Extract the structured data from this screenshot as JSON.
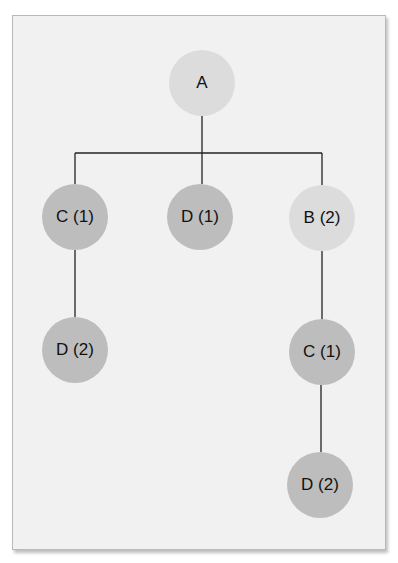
{
  "diagram": {
    "type": "tree",
    "colors": {
      "frame_bg": "#f1f1f1",
      "frame_border": "#b9b9b9",
      "node_light": "#dcdcdc",
      "node_dark": "#bdbdbd",
      "edge": "#222222"
    },
    "nodes": [
      {
        "id": "a",
        "label": "A",
        "x": 202,
        "y": 83,
        "shade": "light"
      },
      {
        "id": "c1-left",
        "label": "C (1)",
        "x": 75,
        "y": 217,
        "shade": "dark"
      },
      {
        "id": "d1-mid",
        "label": "D (1)",
        "x": 200,
        "y": 217,
        "shade": "dark"
      },
      {
        "id": "b2-right",
        "label": "B (2)",
        "x": 322,
        "y": 218,
        "shade": "light"
      },
      {
        "id": "d2-left",
        "label": "D (2)",
        "x": 75,
        "y": 350,
        "shade": "dark"
      },
      {
        "id": "c1-right",
        "label": "C (1)",
        "x": 322,
        "y": 352,
        "shade": "dark"
      },
      {
        "id": "d2-bottom",
        "label": "D (2)",
        "x": 320,
        "y": 485,
        "shade": "dark"
      }
    ],
    "edges": [
      [
        "a",
        "c1-left"
      ],
      [
        "a",
        "d1-mid"
      ],
      [
        "a",
        "b2-right"
      ],
      [
        "c1-left",
        "d2-left"
      ],
      [
        "b2-right",
        "c1-right"
      ],
      [
        "c1-right",
        "d2-bottom"
      ]
    ]
  }
}
